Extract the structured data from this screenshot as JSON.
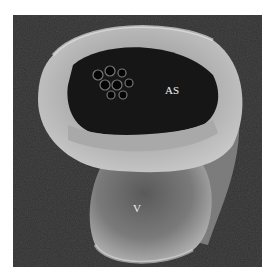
{
  "figure": {
    "type": "scanning-electron-micrograph",
    "labels": [
      {
        "text": "AS",
        "x": 165,
        "y": 85
      },
      {
        "text": "V",
        "x": 133,
        "y": 203
      }
    ],
    "colors": {
      "background": "#ffffff",
      "substrate": "#2e2e2e",
      "tissue_light": "#b8b8b8",
      "lumen_dark": "#151515"
    }
  }
}
